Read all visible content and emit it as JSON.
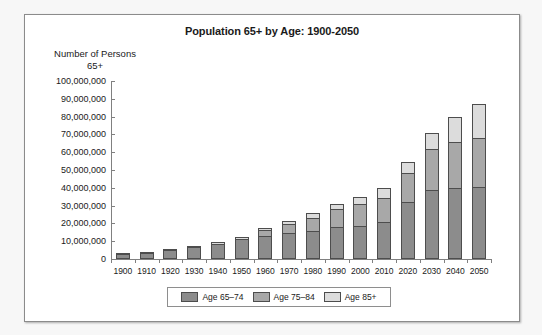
{
  "chart_data": {
    "type": "bar",
    "title": "Population 65+ by Age: 1900-2050",
    "xlabel": "",
    "ylabel": "Number of Persons 65+",
    "ylabel_line1": "Number of Persons",
    "ylabel_line2": "65+",
    "ylim": [
      0,
      100000000
    ],
    "ytick_step": 10000000,
    "ytick_labels": [
      "100,000,000",
      "90,000,000",
      "80,000,000",
      "70,000,000",
      "60,000,000",
      "50,000,000",
      "40,000,000",
      "30,000,000",
      "20,000,000",
      "10,000,000",
      "0"
    ],
    "ytick_values": [
      100000000,
      90000000,
      80000000,
      70000000,
      60000000,
      50000000,
      40000000,
      30000000,
      20000000,
      10000000,
      0
    ],
    "grid": false,
    "stacked": true,
    "legend_position": "bottom",
    "categories": [
      "1900",
      "1910",
      "1920",
      "1930",
      "1940",
      "1950",
      "1960",
      "1970",
      "1980",
      "1990",
      "2000",
      "2010",
      "2020",
      "2030",
      "2040",
      "2050"
    ],
    "series": [
      {
        "name": "Age 65–74",
        "color": "#8c8c8c",
        "values": [
          2700000,
          3600000,
          4900000,
          6700000,
          8400000,
          11000000,
          12700000,
          14600000,
          15600000,
          18100000,
          18400000,
          21000000,
          32300000,
          38600000,
          39700000,
          40200000
        ]
      },
      {
        "name": "Age 75–84",
        "color": "#a8a8a8",
        "values": [
          0,
          0,
          0,
          0,
          0,
          0,
          3700000,
          5300000,
          7700000,
          10100000,
          12400000,
          13100000,
          15800000,
          23400000,
          26000000,
          27800000
        ]
      },
      {
        "name": "Age 85+",
        "color": "#dcdcdc",
        "values": [
          300000,
          400000,
          500000,
          800000,
          1000000,
          1500000,
          1000000,
          1500000,
          2300000,
          3000000,
          4200000,
          5800000,
          6600000,
          8700000,
          14200000,
          19000000
        ]
      }
    ],
    "totals": [
      3000000,
      4000000,
      5400000,
      7500000,
      9400000,
      12500000,
      17400000,
      21400000,
      25600000,
      31200000,
      35000000,
      39900000,
      54700000,
      70700000,
      79900000,
      87000000
    ]
  },
  "legend": {
    "items": [
      {
        "label": "Age 65–74",
        "color": "#8c8c8c"
      },
      {
        "label": "Age 75–84",
        "color": "#a8a8a8"
      },
      {
        "label": "Age 85+",
        "color": "#dcdcdc"
      }
    ]
  },
  "colors": {
    "axis": "#808080",
    "text": "#1a1a1a",
    "bar_outline": "#4d4d4d",
    "page_background": "#ffffff",
    "frame_border": "#8b8b8b"
  }
}
